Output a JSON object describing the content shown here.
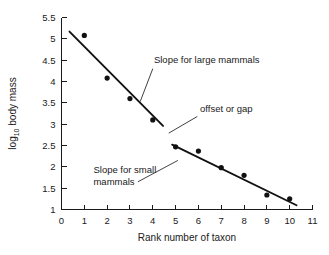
{
  "chart_data": {
    "type": "scatter",
    "title": "",
    "xlabel": "Rank number of taxon",
    "ylabel": "log10 body mass",
    "ylabel_base": "log",
    "ylabel_subscript": "10",
    "ylabel_rest": " body mass",
    "xlim": [
      0,
      11
    ],
    "ylim": [
      1,
      5.5
    ],
    "xticks": [
      0,
      1,
      2,
      3,
      4,
      5,
      6,
      7,
      8,
      9,
      10,
      11
    ],
    "yticks": [
      1,
      1.5,
      2,
      2.5,
      3,
      3.5,
      4,
      4.5,
      5,
      5.5
    ],
    "xtick_labels": [
      "0",
      "1",
      "2",
      "3",
      "4",
      "5",
      "6",
      "7",
      "8",
      "9",
      "10",
      "11"
    ],
    "ytick_labels": [
      "1",
      "1.5",
      "2",
      "2.5",
      "3",
      "3.5",
      "4",
      "4.5",
      "5",
      "5.5"
    ],
    "grid": false,
    "legend": "none",
    "series": [
      {
        "name": "large mammals",
        "x": [
          1,
          2,
          3,
          4
        ],
        "values": [
          5.08,
          4.08,
          3.6,
          3.1
        ]
      },
      {
        "name": "small mammals",
        "x": [
          5,
          6,
          7,
          8,
          9,
          10
        ],
        "values": [
          2.47,
          2.37,
          1.98,
          1.8,
          1.34,
          1.25
        ]
      }
    ],
    "trend_lines": [
      {
        "name": "large-mammal-trend",
        "x0": 0.35,
        "y0": 5.17,
        "x1": 4.45,
        "y1": 2.96
      },
      {
        "name": "small-mammal-trend",
        "x0": 4.85,
        "y0": 2.52,
        "x1": 10.3,
        "y1": 1.1
      }
    ],
    "annotations": [
      {
        "name": "large-mammals-annotation",
        "text": "Slope for large mammals",
        "text_x": 4.05,
        "text_y": 4.44,
        "leader": {
          "x0": 4.0,
          "y0": 4.3,
          "x1": 3.45,
          "y1": 3.53
        }
      },
      {
        "name": "offset-gap-annotation",
        "text": "offset or gap",
        "text_x": 6.07,
        "text_y": 3.28,
        "leader": {
          "x0": 5.95,
          "y0": 3.18,
          "x1": 4.7,
          "y1": 2.79
        }
      },
      {
        "name": "small-mammals-annotation",
        "text_line1": "Slope for small",
        "text_line2": "mammals",
        "text_x": 1.4,
        "text_y": 1.85,
        "leader": {
          "x0": 3.35,
          "y0": 1.65,
          "x1": 5.1,
          "y1": 2.15
        }
      }
    ]
  },
  "colors": {
    "axis": "#1a1a1a",
    "point": "#111111",
    "trend": "#111111",
    "leader": "#2b2b2b",
    "background": "#ffffff"
  }
}
